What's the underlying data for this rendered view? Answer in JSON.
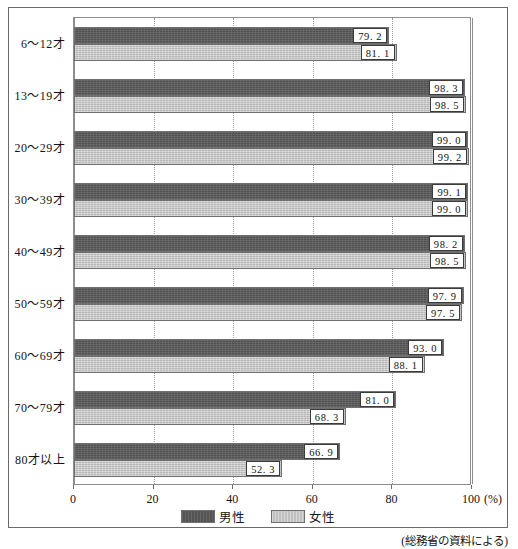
{
  "top_strip_text": "",
  "source_note": "(総務省の資料による)",
  "axis": {
    "unit_label": "(%)",
    "ticks": [
      0,
      20,
      40,
      60,
      80,
      100
    ],
    "tick_labels": [
      "0",
      "20",
      "40",
      "60",
      "80",
      "100"
    ]
  },
  "legend": {
    "male_label": "男性",
    "female_label": "女性"
  },
  "chart_data": {
    "type": "bar",
    "orientation": "horizontal",
    "title": "",
    "subtitle": "",
    "xlabel": "(%)",
    "ylabel": "",
    "xlim": [
      0,
      100
    ],
    "grid": true,
    "grid_axis": "x",
    "legend_position": "bottom-center",
    "categories": [
      "6〜12才",
      "13〜19才",
      "20〜29才",
      "30〜39才",
      "40〜49才",
      "50〜59才",
      "60〜69才",
      "70〜79才",
      "80才以上"
    ],
    "series": [
      {
        "name": "男性",
        "color": "#595959",
        "values": [
          79.2,
          98.3,
          99.0,
          99.1,
          98.2,
          97.9,
          93.0,
          81.0,
          66.9
        ],
        "labels": [
          "79. 2",
          "98. 3",
          "99. 0",
          "99. 1",
          "98. 2",
          "97. 9",
          "93. 0",
          "81. 0",
          "66. 9"
        ]
      },
      {
        "name": "女性",
        "color": "#c8c8c8",
        "values": [
          81.1,
          98.5,
          99.2,
          99.0,
          98.5,
          97.5,
          88.1,
          68.3,
          52.3
        ],
        "labels": [
          "81. 1",
          "98. 5",
          "99. 2",
          "99. 0",
          "98. 5",
          "97. 5",
          "88. 1",
          "68. 3",
          "52. 3"
        ]
      }
    ]
  }
}
